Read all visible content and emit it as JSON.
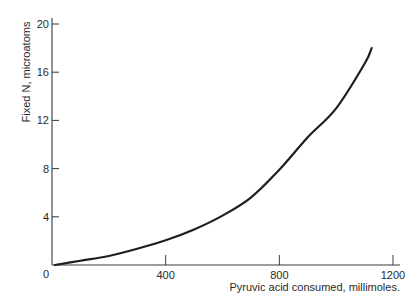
{
  "chart_data": {
    "type": "line",
    "title": "",
    "xlabel": "Pyruvic acid consumed, millimoles.",
    "ylabel": "Fixed N, microatoms",
    "xlim": [
      0,
      1200
    ],
    "ylim": [
      0,
      20
    ],
    "x_ticks": [
      0,
      400,
      800,
      1200
    ],
    "x_tick_labels": [
      "0",
      "400",
      "800",
      "1200"
    ],
    "y_ticks": [
      4,
      8,
      12,
      16,
      20
    ],
    "y_tick_labels": [
      "4",
      "8",
      "12",
      "16",
      "20"
    ],
    "origin_label": "0",
    "grid": false,
    "legend": null,
    "series": [
      {
        "name": "Fixed N vs pyruvic acid consumed",
        "color": "#1e1e1e",
        "x": [
          10,
          100,
          200,
          300,
          400,
          500,
          600,
          700,
          800,
          900,
          1000,
          1100,
          1125
        ],
        "y": [
          0.0,
          0.35,
          0.75,
          1.35,
          2.05,
          2.95,
          4.1,
          5.6,
          7.9,
          10.6,
          13.0,
          16.7,
          18.0
        ]
      }
    ]
  },
  "colors": {
    "ink": "#2a2a2a",
    "curve": "#1e1e1e",
    "background": "#ffffff"
  }
}
